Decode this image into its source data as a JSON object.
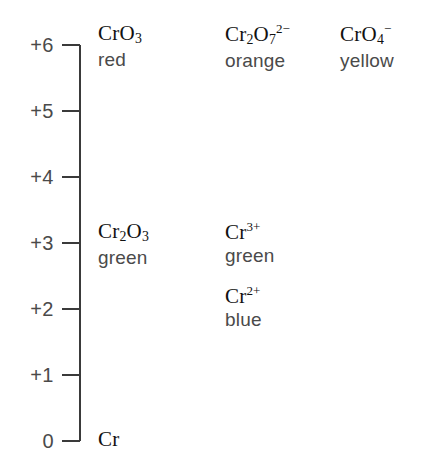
{
  "figure": {
    "background_color": "#ffffff",
    "line_color": "#3a3a3a",
    "formula_color": "#111111",
    "label_color": "#4a4a4a"
  },
  "axis": {
    "name": "oxidation-state-axis",
    "orientation": "vertical",
    "min": 0,
    "max": 6,
    "ticks": [
      {
        "value": 6,
        "label": "+6"
      },
      {
        "value": 5,
        "label": "+5"
      },
      {
        "value": 4,
        "label": "+4"
      },
      {
        "value": 3,
        "label": "+3"
      },
      {
        "value": 2,
        "label": "+2"
      },
      {
        "value": 1,
        "label": "+1"
      },
      {
        "value": 0,
        "label": "0"
      }
    ]
  },
  "chart_data": {
    "type": "table",
    "xlabel": "",
    "ylabel": "Oxidation state",
    "ylim": [
      0,
      6
    ],
    "grid": false,
    "legend": null,
    "axis_ticks": [
      "+6",
      "+5",
      "+4",
      "+3",
      "+2",
      "+1",
      "0"
    ],
    "columns": [
      "column 1",
      "column 2",
      "column 3"
    ],
    "entries": [
      {
        "oxidation_state": 6,
        "column": 1,
        "formula_html": "CrO<sub>3</sub>",
        "formula_plain": "CrO3",
        "colour": "red"
      },
      {
        "oxidation_state": 6,
        "column": 2,
        "formula_html": "Cr<sub>2</sub>O<sub>7</sub><sup>2−</sup>",
        "formula_plain": "Cr2O7 2-",
        "colour": "orange"
      },
      {
        "oxidation_state": 6,
        "column": 3,
        "formula_html": "CrO<sub>4</sub><sup>−</sup>",
        "formula_plain": "CrO4 -",
        "colour": "yellow"
      },
      {
        "oxidation_state": 3,
        "column": 1,
        "formula_html": "Cr<sub>2</sub>O<sub>3</sub>",
        "formula_plain": "Cr2O3",
        "colour": "green"
      },
      {
        "oxidation_state": 3,
        "column": 2,
        "formula_html": "Cr<sup>3+</sup>",
        "formula_plain": "Cr3+",
        "colour": "green"
      },
      {
        "oxidation_state": 2,
        "column": 2,
        "formula_html": "Cr<sup>2+</sup>",
        "formula_plain": "Cr2+",
        "colour": "blue"
      },
      {
        "oxidation_state": 0,
        "column": 1,
        "formula_html": "Cr",
        "formula_plain": "Cr",
        "colour": ""
      }
    ]
  }
}
